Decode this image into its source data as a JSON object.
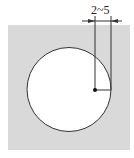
{
  "diagram": {
    "dimension_label": "2~5",
    "colors": {
      "background": "#ffffff",
      "plate_fill": "#d9d9d9",
      "hole_fill": "#ffffff",
      "stroke": "#333333"
    },
    "plate": {
      "x": 8,
      "y": 25,
      "width": 122,
      "height": 125
    },
    "hole": {
      "cx": 69,
      "cy": 89.5,
      "r": 42
    },
    "center_point": {
      "x": 95,
      "y": 90
    },
    "dimension": {
      "left_x": 95,
      "right_x": 111,
      "arrow_y": 21,
      "ext_top": 16
    }
  }
}
